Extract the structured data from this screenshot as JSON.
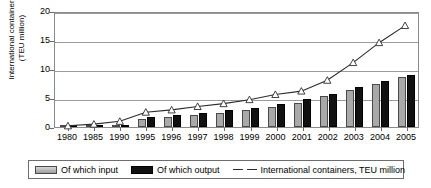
{
  "chart_data": {
    "type": "bar",
    "title": "",
    "subtitle": "",
    "xlabel": "",
    "ylabel": "International containers (TEU million)",
    "ylabel_lines": [
      "International containers",
      "(TEU million)"
    ],
    "ylim": [
      0,
      20
    ],
    "yticks": [
      0,
      5,
      10,
      15,
      20
    ],
    "grid": true,
    "legend_position": "bottom",
    "categories": [
      "1980",
      "1985",
      "1990",
      "1995",
      "1996",
      "1997",
      "1998",
      "1999",
      "2000",
      "2001",
      "2002",
      "2003",
      "2004",
      "2005"
    ],
    "series": [
      {
        "name": "Of which input",
        "type": "bar",
        "color": "#a9a9a9",
        "values": [
          0.05,
          0.1,
          0.3,
          1.4,
          1.8,
          2.1,
          2.4,
          2.9,
          3.4,
          4.2,
          5.3,
          6.3,
          7.5,
          8.6
        ]
      },
      {
        "name": "Of which output",
        "type": "bar",
        "color": "#111111",
        "values": [
          0.05,
          0.15,
          0.4,
          1.7,
          2.1,
          2.5,
          2.9,
          3.3,
          4.0,
          4.8,
          5.7,
          6.9,
          8.0,
          9.0
        ]
      },
      {
        "name": "International containers, TEU million",
        "type": "line",
        "color": "#2b2b2b",
        "marker": "triangle",
        "values": [
          0.2,
          0.5,
          1.0,
          2.6,
          3.0,
          3.6,
          4.1,
          4.8,
          5.7,
          6.3,
          8.2,
          11.3,
          14.8,
          17.8
        ]
      }
    ],
    "legend": [
      {
        "label": "Of which input",
        "swatch": "gray-bar-swatch"
      },
      {
        "label": "Of which output",
        "swatch": "black-bar-swatch"
      },
      {
        "label": "International containers, TEU million",
        "swatch": "line-triangle-swatch"
      }
    ],
    "colors": {
      "input_bar": "#a9a9a9",
      "output_bar": "#111111",
      "line": "#2b2b2b",
      "gridline": "#9a9a9a",
      "frame": "#8a8a8a",
      "background": "#ffffff"
    }
  }
}
